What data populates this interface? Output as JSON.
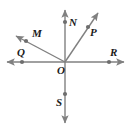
{
  "diagram": {
    "type": "ray-diagram",
    "background_color": "#ffffff",
    "line_color": "#808080",
    "dot_color": "#6e6e6e",
    "label_color": "#1a1a1a",
    "origin": {
      "name": "O",
      "label": "O",
      "x": 65,
      "y": 62,
      "label_x": 57,
      "label_y": 65
    },
    "lines": [
      {
        "name": "horizontal-line-QR",
        "x1": 7,
        "y1": 62,
        "x2": 124,
        "y2": 62,
        "arrow_start": true,
        "arrow_end": true
      },
      {
        "name": "vertical-line-NS",
        "x1": 65,
        "y1": 10,
        "x2": 65,
        "y2": 123,
        "arrow_start": true,
        "arrow_end": true
      },
      {
        "name": "ray-OM",
        "x1": 65,
        "y1": 62,
        "x2": 16,
        "y2": 36,
        "arrow_start": false,
        "arrow_end": true
      },
      {
        "name": "ray-OP",
        "x1": 65,
        "y1": 62,
        "x2": 98,
        "y2": 13,
        "arrow_start": false,
        "arrow_end": true
      }
    ],
    "points": [
      {
        "name": "point-M",
        "label": "M",
        "x": 26,
        "y": 41,
        "label_x": 32,
        "label_y": 28
      },
      {
        "name": "point-N",
        "label": "N",
        "x": 65,
        "y": 22,
        "label_x": 69,
        "label_y": 17
      },
      {
        "name": "point-P",
        "label": "P",
        "x": 88,
        "y": 27,
        "label_x": 90,
        "label_y": 27
      },
      {
        "name": "point-Q",
        "label": "Q",
        "x": 22,
        "y": 62,
        "label_x": 17,
        "label_y": 47
      },
      {
        "name": "point-R",
        "label": "R",
        "x": 109,
        "y": 62,
        "label_x": 110,
        "label_y": 47
      },
      {
        "name": "point-S",
        "label": "S",
        "x": 65,
        "y": 94,
        "label_x": 56,
        "label_y": 97
      }
    ]
  }
}
